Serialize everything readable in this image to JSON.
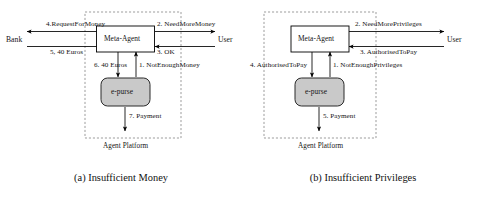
{
  "figure": {
    "panels": [
      {
        "id": "a",
        "caption": "(a) Insufficient Money",
        "platform_label": "Agent Platform",
        "nodes": {
          "meta_agent": "Meta-Agent",
          "purse": "e-purse",
          "left_actor": "Bank",
          "right_actor": "User"
        },
        "messages": [
          {
            "seq": "1",
            "label": "1. NotEnoughMoney",
            "from": "e-purse",
            "to": "Meta-Agent",
            "direction": "up"
          },
          {
            "seq": "2",
            "label": "2. NeedMoreMoney",
            "from": "Meta-Agent",
            "to": "User",
            "direction": "right"
          },
          {
            "seq": "3",
            "label": "3. OK",
            "from": "User",
            "to": "Meta-Agent",
            "direction": "left"
          },
          {
            "seq": "4",
            "label": "4.RequestForMoney",
            "from": "Meta-Agent",
            "to": "Bank",
            "direction": "left"
          },
          {
            "seq": "5",
            "label": "5, 40 Euros",
            "from": "Bank",
            "to": "Meta-Agent",
            "direction": "right"
          },
          {
            "seq": "6",
            "label": "6. 40 Euros",
            "from": "Meta-Agent",
            "to": "e-purse",
            "direction": "down"
          },
          {
            "seq": "7",
            "label": "7. Payment",
            "from": "e-purse",
            "to": "outside",
            "direction": "down"
          }
        ]
      },
      {
        "id": "b",
        "caption": "(b) Insufficient Privileges",
        "platform_label": "Agent Platform",
        "nodes": {
          "meta_agent": "Meta-Agent",
          "purse": "e-purse",
          "left_actor": "",
          "right_actor": "User"
        },
        "messages": [
          {
            "seq": "1",
            "label": "1. NotEnoughPrivileges",
            "from": "e-purse",
            "to": "Meta-Agent",
            "direction": "up"
          },
          {
            "seq": "2",
            "label": "2. NeedMorePrivileges",
            "from": "Meta-Agent",
            "to": "User",
            "direction": "right"
          },
          {
            "seq": "3",
            "label": "3. AuthorisedToPay",
            "from": "User",
            "to": "Meta-Agent",
            "direction": "left"
          },
          {
            "seq": "4",
            "label": "4. AuthorisedToPay",
            "from": "Meta-Agent",
            "to": "e-purse",
            "direction": "down"
          },
          {
            "seq": "5",
            "label": "5. Payment",
            "from": "e-purse",
            "to": "outside",
            "direction": "down"
          }
        ]
      }
    ]
  },
  "colors": {
    "line": "#000000",
    "purse_fill": "#c9c9c9",
    "platform_border": "#8c8c8c",
    "text": "#141414",
    "background": "#ffffff"
  }
}
